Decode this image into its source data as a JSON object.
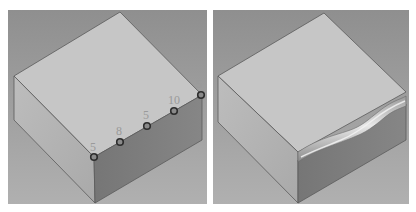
{
  "colors": {
    "background": "#9c9c9c",
    "top_face": "#c4c4c4",
    "left_face": "#b3b3b3",
    "front_face": "#7d7d7d",
    "edge": "#555555",
    "marker_stroke": "#2e2e2e",
    "marker_fill": "#8a8a8a",
    "label": "#a0a0a0"
  },
  "left_panel": {
    "title": "",
    "control_points": [
      {
        "label": "5",
        "x": 86,
        "y": 147
      },
      {
        "label": "8",
        "x": 112,
        "y": 132
      },
      {
        "label": "5",
        "x": 139,
        "y": 116
      },
      {
        "label": "10",
        "x": 166,
        "y": 101
      },
      {
        "label": "5",
        "x": 193,
        "y": 85
      }
    ]
  },
  "right_panel": {
    "title": ""
  }
}
